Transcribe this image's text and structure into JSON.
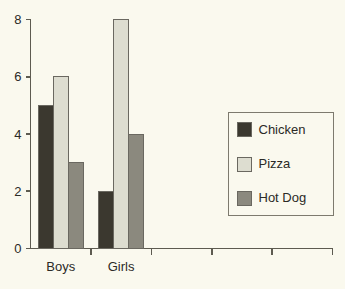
{
  "chart_data": {
    "type": "bar",
    "title": "",
    "subtitle": "",
    "xlabel": "",
    "ylabel": "",
    "categories": [
      "Boys",
      "Girls"
    ],
    "series": [
      {
        "name": "Chicken",
        "values": [
          5,
          2
        ],
        "color": "#3b382f"
      },
      {
        "name": "Pizza",
        "values": [
          6,
          8
        ],
        "color": "#ddddd0"
      },
      {
        "name": "Hot Dog",
        "values": [
          3,
          4
        ],
        "color": "#8b897e"
      }
    ],
    "ylim": [
      0,
      8
    ],
    "yticks": [
      0,
      2,
      4,
      6,
      8
    ],
    "ytick_labels": [
      "0",
      "2",
      "4",
      "6",
      "8"
    ],
    "xtick_labels": [
      "Boys",
      "Girls",
      "",
      "",
      ""
    ],
    "xtick_count": 5,
    "grid": false,
    "legend_position": "right"
  },
  "style": {
    "background": "#faf9ee",
    "axis_color": "#5d5b50",
    "text_color": "#2b2a26",
    "legend_border": "#7d7a6e",
    "bar_border": "#6a6860"
  },
  "legend": {
    "entries": [
      "Chicken",
      "Pizza",
      "Hot Dog"
    ]
  },
  "axes": {
    "y_labels": [
      "8",
      "6",
      "4",
      "2",
      "0"
    ],
    "x_labels": [
      "Boys",
      "Girls"
    ]
  }
}
